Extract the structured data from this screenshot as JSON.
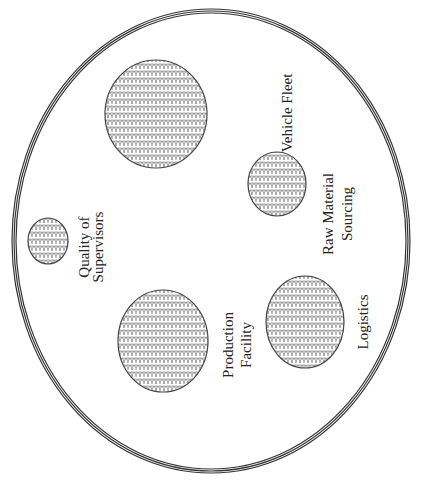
{
  "diagram": {
    "type": "venn-style bubble diagram",
    "orientation": "rotated -90deg (text reads bottom-to-top)",
    "outer_boundary": {
      "shape": "ellipse",
      "stroke": "triple-line",
      "color": "#333333"
    },
    "fill_pattern": "scale",
    "colors": {
      "stroke": "#444444",
      "pattern": "#777777",
      "text": "#222222",
      "background": "#ffffff"
    },
    "bubbles": [
      {
        "id": "vehicle-fleet",
        "lines": [
          "Vehicle Fleet"
        ]
      },
      {
        "id": "raw-material-sourcing",
        "lines": [
          "Raw Material",
          "Sourcing"
        ]
      },
      {
        "id": "quality-of-supervisors",
        "lines": [
          "Quality of",
          "Supervisors"
        ]
      },
      {
        "id": "production-facility",
        "lines": [
          "Production",
          "Facility"
        ]
      },
      {
        "id": "logistics",
        "lines": [
          "Logistics"
        ]
      }
    ]
  }
}
